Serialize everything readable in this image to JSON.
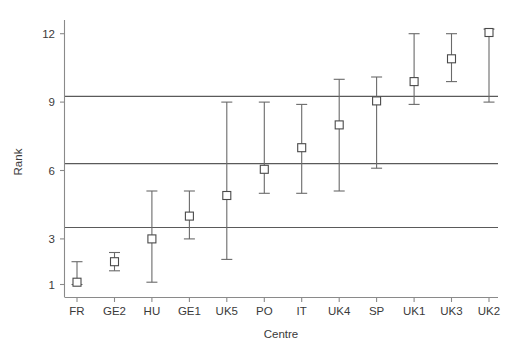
{
  "chart_data": {
    "type": "scatter",
    "title": "",
    "xlabel": "Centre",
    "ylabel": "Rank",
    "categories": [
      "FR",
      "GE2",
      "HU",
      "GE1",
      "UK5",
      "PO",
      "IT",
      "UK4",
      "SP",
      "UK1",
      "UK3",
      "UK2"
    ],
    "values": [
      1.1,
      2.0,
      3.0,
      4.0,
      4.9,
      6.05,
      7.0,
      8.0,
      9.05,
      9.9,
      10.9,
      12.05
    ],
    "error_low": [
      1.0,
      1.6,
      1.1,
      3.0,
      2.1,
      5.0,
      5.0,
      5.1,
      6.1,
      8.9,
      9.9,
      9.0
    ],
    "error_high": [
      2.0,
      2.4,
      5.1,
      5.1,
      9.0,
      9.0,
      8.9,
      10.0,
      10.1,
      12.0,
      12.0,
      12.2
    ],
    "ylim": [
      0.45,
      12.6
    ],
    "ytick_values": [
      1,
      3,
      6,
      9,
      12
    ],
    "ytick_labels": [
      "1",
      "3",
      "6",
      "9",
      "12"
    ],
    "xtick_labels": [
      "FR",
      "GE2",
      "HU",
      "GE1",
      "UK5",
      "PO",
      "IT",
      "UK4",
      "SP",
      "UK1",
      "UK3",
      "UK2"
    ],
    "reference_lines": [
      3.5,
      6.3,
      9.25
    ],
    "grid": false,
    "legend": "none",
    "marker_style": "open-square",
    "series": [
      {
        "name": "Rank with confidence interval",
        "points": [
          {
            "centre": "FR",
            "rank": 1.1,
            "lower": 1.0,
            "upper": 2.0
          },
          {
            "centre": "GE2",
            "rank": 2.0,
            "lower": 1.6,
            "upper": 2.4
          },
          {
            "centre": "HU",
            "rank": 3.0,
            "lower": 1.1,
            "upper": 5.1
          },
          {
            "centre": "GE1",
            "rank": 4.0,
            "lower": 3.0,
            "upper": 5.1
          },
          {
            "centre": "UK5",
            "rank": 4.9,
            "lower": 2.1,
            "upper": 9.0
          },
          {
            "centre": "PO",
            "rank": 6.05,
            "lower": 5.0,
            "upper": 9.0
          },
          {
            "centre": "IT",
            "rank": 7.0,
            "lower": 5.0,
            "upper": 8.9
          },
          {
            "centre": "UK4",
            "rank": 8.0,
            "lower": 5.1,
            "upper": 10.0
          },
          {
            "centre": "SP",
            "rank": 9.05,
            "lower": 6.1,
            "upper": 10.1
          },
          {
            "centre": "UK1",
            "rank": 9.9,
            "lower": 8.9,
            "upper": 12.0
          },
          {
            "centre": "UK3",
            "rank": 10.9,
            "lower": 9.9,
            "upper": 12.0
          },
          {
            "centre": "UK2",
            "rank": 12.05,
            "lower": 9.0,
            "upper": 12.2
          }
        ]
      }
    ]
  },
  "colors": {
    "background": "#ffffff",
    "axis": "#8a8a8a",
    "reference_line": "#5a5a5a",
    "error_bar": "#6a6a6a",
    "marker_stroke": "#4a4a4a",
    "marker_fill": "#ffffff",
    "text": "#3a3a3a"
  }
}
